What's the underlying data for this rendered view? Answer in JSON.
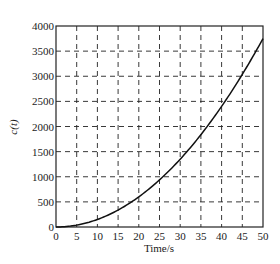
{
  "chart_data": {
    "type": "line",
    "title": "",
    "xlabel": "Time/s",
    "ylabel": "c(t)",
    "xlim": [
      0,
      50
    ],
    "ylim": [
      0,
      4000
    ],
    "xticks": [
      0,
      5,
      10,
      15,
      20,
      25,
      30,
      35,
      40,
      45,
      50
    ],
    "yticks": [
      0,
      500,
      1000,
      1500,
      2000,
      2500,
      3000,
      3500,
      4000
    ],
    "grid": true,
    "grid_style": "dashed",
    "legend": null,
    "series": [
      {
        "name": "c(t)",
        "x": [
          0,
          5,
          10,
          15,
          20,
          25,
          30,
          35,
          40,
          45,
          50
        ],
        "values": [
          0,
          38,
          150,
          338,
          600,
          938,
          1350,
          1838,
          2400,
          3038,
          3750
        ]
      }
    ]
  },
  "colors": {
    "line": "#111111",
    "grid": "#222222",
    "axis": "#222222"
  }
}
